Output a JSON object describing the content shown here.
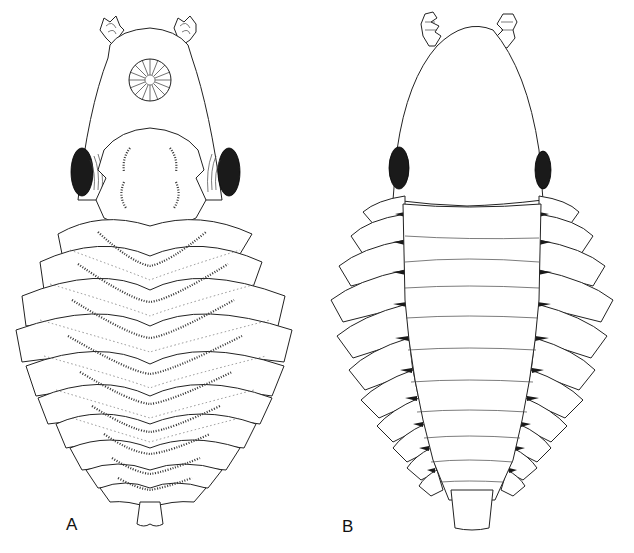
{
  "figure": {
    "panels": [
      {
        "id": "A",
        "label": "A",
        "view": "ventral"
      },
      {
        "id": "B",
        "label": "B",
        "view": "dorsal"
      }
    ],
    "colors": {
      "line": "#222222",
      "eye_fill": "#1a1a1a",
      "background": "#ffffff"
    }
  }
}
